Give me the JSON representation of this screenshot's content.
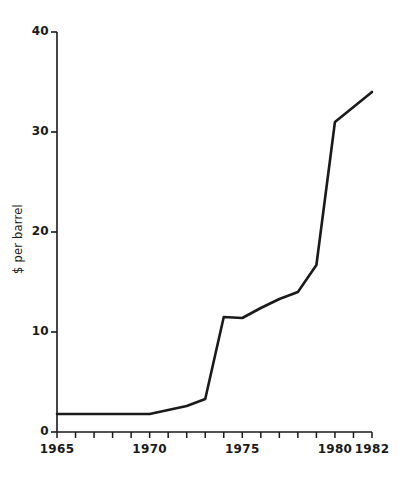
{
  "chart_data": {
    "type": "line",
    "title": "",
    "xlabel": "",
    "ylabel": "$ per barrel",
    "xlim": [
      1965,
      1982
    ],
    "ylim": [
      0,
      40
    ],
    "grid": false,
    "legend": "none",
    "x_tick_labels": [
      "1965",
      "1970",
      "1975",
      "1980",
      "1982"
    ],
    "x_tick_values": [
      1965,
      1970,
      1975,
      1980,
      1982
    ],
    "x_minor_ticks": [
      1966,
      1967,
      1968,
      1969,
      1971,
      1972,
      1973,
      1974,
      1976,
      1977,
      1978,
      1979,
      1981
    ],
    "y_tick_labels": [
      "0",
      "10",
      "20",
      "30",
      "40"
    ],
    "y_tick_values": [
      0,
      10,
      20,
      30,
      40
    ],
    "series": [
      {
        "name": "$ per barrel",
        "color": "#1a1a1a",
        "x": [
          1965,
          1966,
          1967,
          1968,
          1969,
          1970,
          1971,
          1972,
          1973,
          1974,
          1975,
          1976,
          1977,
          1978,
          1979,
          1980,
          1982
        ],
        "values": [
          1.8,
          1.8,
          1.8,
          1.8,
          1.8,
          1.8,
          2.2,
          2.6,
          3.3,
          11.5,
          11.4,
          12.4,
          13.3,
          14.0,
          16.7,
          31.0,
          34.0
        ]
      }
    ]
  },
  "axis": {
    "y_axis_name": "y-axis",
    "x_axis_name": "x-axis"
  }
}
